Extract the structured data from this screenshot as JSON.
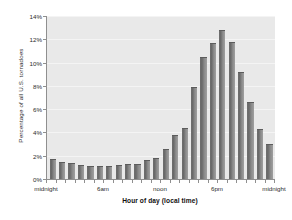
{
  "chart_data": {
    "type": "bar",
    "title": "",
    "xlabel": "Hour of day (local time)",
    "ylabel": "Percentage of all U.S. tornadoes",
    "ylim": [
      0,
      14
    ],
    "ytick_labels": [
      "0%",
      "2%",
      "4%",
      "6%",
      "8%",
      "10%",
      "12%",
      "14%"
    ],
    "ytick_values": [
      0,
      2,
      4,
      6,
      8,
      10,
      12,
      14
    ],
    "grid": true,
    "legend": "none",
    "xtick_labels": [
      "midnight",
      "6am",
      "noon",
      "6pm",
      "midnight"
    ],
    "xtick_positions": [
      0,
      6,
      12,
      18,
      24
    ],
    "categories": [
      "midnight",
      "1am",
      "2am",
      "3am",
      "4am",
      "5am",
      "6am",
      "7am",
      "8am",
      "9am",
      "10am",
      "11am",
      "noon",
      "1pm",
      "2pm",
      "3pm",
      "4pm",
      "5pm",
      "6pm",
      "7pm",
      "8pm",
      "9pm",
      "10pm",
      "11pm"
    ],
    "values": [
      1.7,
      1.5,
      1.4,
      1.2,
      1.1,
      1.1,
      1.1,
      1.2,
      1.3,
      1.3,
      1.6,
      1.8,
      2.6,
      3.8,
      4.4,
      7.9,
      10.5,
      11.7,
      12.8,
      11.8,
      9.2,
      6.6,
      4.3,
      3.0
    ],
    "bar_color": "#6e6e6e",
    "plot_background": "#e9e9e9",
    "axis_color": "#8f8f8f",
    "text_color": "#2b2b2b"
  }
}
